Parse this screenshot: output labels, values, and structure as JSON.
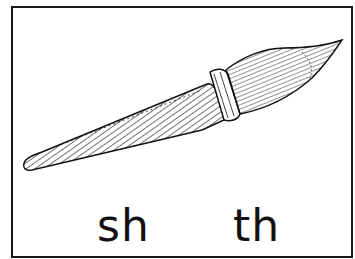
{
  "card": {
    "illustration": "paintbrush",
    "choices": [
      {
        "label": "sh"
      },
      {
        "label": "th"
      }
    ]
  },
  "colors": {
    "ink": "#111111",
    "background": "#ffffff"
  }
}
